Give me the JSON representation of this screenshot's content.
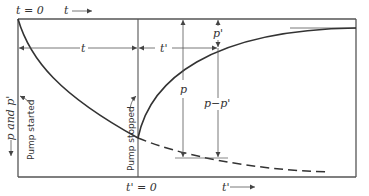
{
  "diagram": {
    "type": "pressure buildup / drawdown schematic",
    "labels": {
      "t_zero": "t = 0",
      "t_arrow": "t",
      "t_span": "t",
      "t_prime_span": "t'",
      "t_prime_zero": "t' = 0",
      "t_prime_arrow": "t'",
      "y_axis": "p and p'",
      "pump_started": "Pump started",
      "pump_stopped": "Pump stopped",
      "p": "p",
      "p_prime": "p'",
      "p_minus_p_prime": "p−p'"
    },
    "colors": {
      "line": "#333333",
      "thin_line": "#555555",
      "frame": "#555555"
    }
  }
}
